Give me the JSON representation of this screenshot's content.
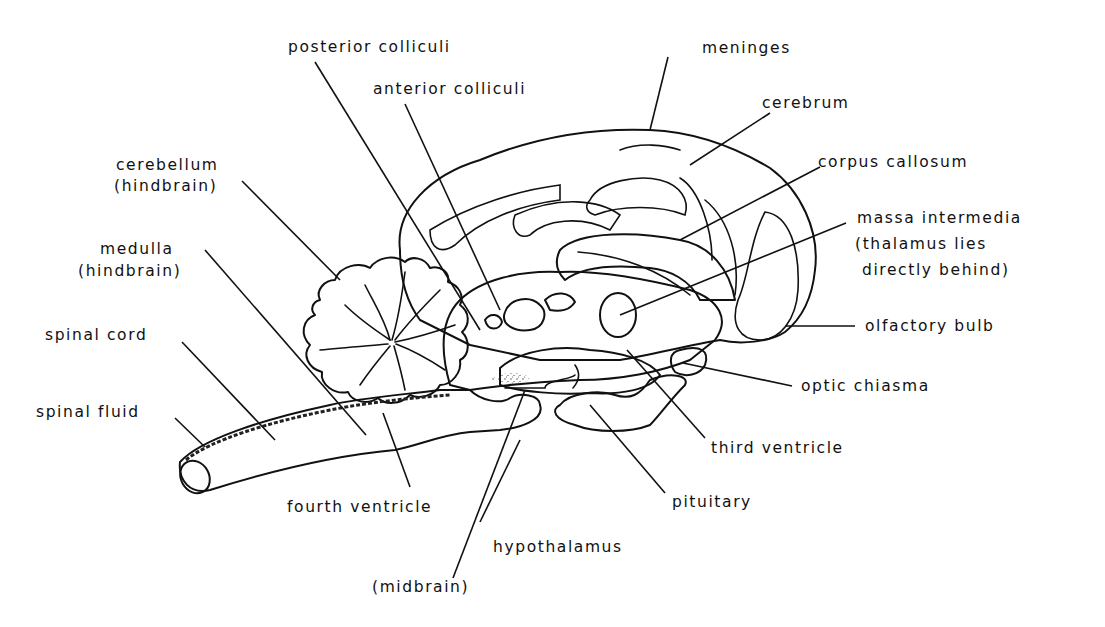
{
  "diagram": {
    "labels": {
      "posterior_colliculi": "posterior colliculi",
      "anterior_colliculi": "anterior colliculi",
      "meninges": "meninges",
      "cerebrum": "cerebrum",
      "corpus_callosum": "corpus callosum",
      "cerebellum": "cerebellum",
      "cerebellum_note": "(hindbrain)",
      "medulla": "medulla",
      "medulla_note": "(hindbrain)",
      "massa_intermedia": "massa intermedia",
      "massa_note_1": "(thalamus lies",
      "massa_note_2": "directly behind)",
      "olfactory_bulb": "olfactory bulb",
      "spinal_cord": "spinal cord",
      "spinal_fluid": "spinal fluid",
      "optic_chiasma": "optic chiasma",
      "third_ventricle": "third ventricle",
      "fourth_ventricle": "fourth ventricle",
      "pituitary": "pituitary",
      "hypothalamus": "hypothalamus",
      "midbrain": "(midbrain)"
    },
    "colors": {
      "ink": "#111111",
      "background": "#ffffff",
      "stipple": "#555555"
    }
  }
}
